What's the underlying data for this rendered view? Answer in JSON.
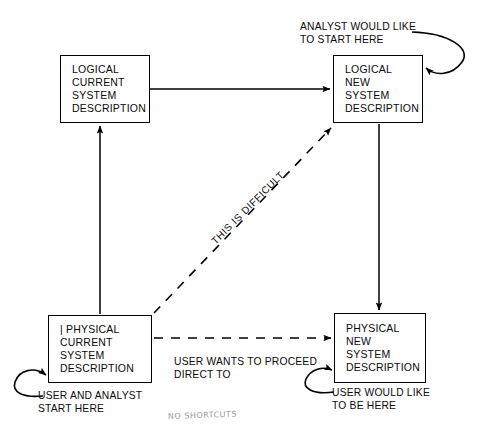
{
  "diagram": {
    "stroke_color": "#000000",
    "background_color": "#ffffff",
    "boxes": [
      {
        "id": "logical-current",
        "lines": [
          "LOGICAL",
          "CURRENT",
          "SYSTEM",
          "DESCRIPTION"
        ]
      },
      {
        "id": "logical-new",
        "lines": [
          "LOGICAL",
          "NEW",
          "SYSTEM",
          "DESCRIPTION"
        ]
      },
      {
        "id": "physical-current",
        "lines": [
          "| PHYSICAL",
          "CURRENT",
          "SYSTEM",
          "DESCRIPTION"
        ]
      },
      {
        "id": "physical-new",
        "lines": [
          "PHYSICAL",
          "NEW",
          "SYSTEM",
          "DESCRIPTION"
        ]
      }
    ],
    "annotations": {
      "analyst_start": {
        "line1": "ANALYST WOULD LIKE",
        "line2": "TO START HERE"
      },
      "user_analyst_start": {
        "line1": "USER AND ANALYST",
        "line2": "START HERE"
      },
      "user_be_here": {
        "line1": "USER WOULD LIKE",
        "line2": "TO BE HERE"
      },
      "direct_to": {
        "line1": "USER WANTS TO PROCEED",
        "line2": "DIRECT TO"
      },
      "difficult": "THIS IS DIFFICULT",
      "handwritten_note": "NO SHORTCUTS"
    },
    "connectors": [
      {
        "id": "physical-current-to-logical-current",
        "style": "solid",
        "direction": "up"
      },
      {
        "id": "logical-current-to-logical-new",
        "style": "solid",
        "direction": "right"
      },
      {
        "id": "logical-new-to-physical-new",
        "style": "solid",
        "direction": "down"
      },
      {
        "id": "physical-current-to-logical-new",
        "style": "dashed",
        "direction": "diagonal-up-right",
        "label": "THIS IS DIFFICULT"
      },
      {
        "id": "physical-current-to-physical-new",
        "style": "dashed",
        "direction": "right",
        "label": "USER WANTS TO PROCEED DIRECT TO"
      },
      {
        "id": "analyst-start-hook",
        "style": "curved",
        "direction": "into-logical-new"
      },
      {
        "id": "user-analyst-start-hook",
        "style": "curved",
        "direction": "into-physical-current"
      },
      {
        "id": "user-be-here-hook",
        "style": "curved",
        "direction": "into-physical-new"
      }
    ]
  }
}
